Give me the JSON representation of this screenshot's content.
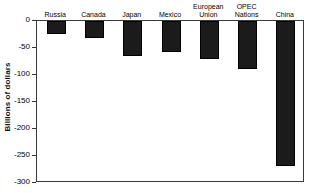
{
  "chart_data": {
    "type": "bar",
    "title": "",
    "subtitle": "",
    "xlabel": "",
    "ylabel": "Billions of dollars",
    "categories": [
      "Russia",
      "Canada",
      "Japan",
      "Mexico",
      "European Union",
      "OPEC Nations",
      "China"
    ],
    "values": [
      -24,
      -31,
      -64,
      -58,
      -70,
      -89,
      -268
    ],
    "ylim": [
      -300,
      0
    ],
    "yticks": [
      0,
      -50,
      -100,
      -150,
      -200,
      -250,
      -300
    ],
    "ytick_labels": [
      "0",
      "-50",
      "-100",
      "-150",
      "-200",
      "-250",
      "-300"
    ],
    "grid": false,
    "legend": false,
    "legend_position": "none",
    "orientation": "vertical",
    "bar_color": "#1b1b1b",
    "axis_color": "#3a3a3a",
    "category_label_position": "above-zero-line"
  }
}
